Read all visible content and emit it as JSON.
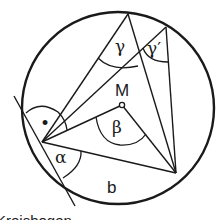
{
  "diagram": {
    "labels": {
      "gamma": "γ",
      "gamma_prime": "γ′",
      "center": "M",
      "beta": "β",
      "alpha": "α",
      "arc": "b",
      "right_angle_dot": "•",
      "caption": "Kreisbogen"
    },
    "colors": {
      "stroke": "#1a1a1a",
      "background": "#ffffff"
    }
  }
}
